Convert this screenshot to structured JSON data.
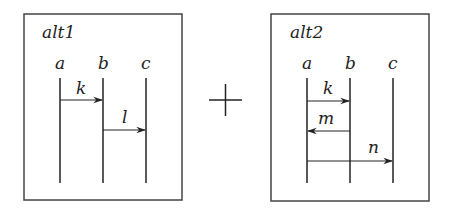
{
  "diagram": {
    "type": "sequence-diagram-composition",
    "operator": "+",
    "colors": {
      "stroke": "#222222",
      "frame": "#444444",
      "background": "#ffffff"
    },
    "frames": [
      {
        "title": "alt1",
        "lifelines": [
          "a",
          "b",
          "c"
        ],
        "messages": [
          {
            "label": "k",
            "from": "a",
            "to": "b"
          },
          {
            "label": "l",
            "from": "b",
            "to": "c"
          }
        ]
      },
      {
        "title": "alt2",
        "lifelines": [
          "a",
          "b",
          "c"
        ],
        "messages": [
          {
            "label": "k",
            "from": "a",
            "to": "b"
          },
          {
            "label": "m",
            "from": "b",
            "to": "a"
          },
          {
            "label": "n",
            "from": "a",
            "to": "c"
          }
        ]
      }
    ]
  }
}
